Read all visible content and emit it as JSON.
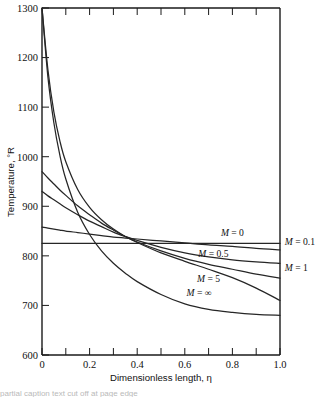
{
  "chart_data": {
    "type": "line",
    "title": "",
    "xlabel": "Dimensionless length, η",
    "ylabel": "Temperature, °R",
    "xlim": [
      0,
      1.0
    ],
    "ylim": [
      600,
      1300
    ],
    "grid": false,
    "legend_position": "inline-right",
    "xticks": [
      0,
      0.2,
      0.4,
      0.6,
      0.8,
      1.0
    ],
    "xticklabels": [
      "0",
      "0.2",
      "0.4",
      "0.6",
      "0.8",
      "1.0"
    ],
    "xminorticks": [
      0.1,
      0.3,
      0.5,
      0.7,
      0.9
    ],
    "yticks": [
      600,
      700,
      800,
      900,
      1000,
      1100,
      1200,
      1300
    ],
    "yticklabels": [
      "600",
      "700",
      "800",
      "900",
      "1000",
      "1100",
      "1200",
      "1300"
    ],
    "x": [
      0,
      0.025,
      0.05,
      0.075,
      0.1,
      0.15,
      0.2,
      0.25,
      0.3,
      0.35,
      0.4,
      0.5,
      0.6,
      0.7,
      0.8,
      0.9,
      1.0
    ],
    "series": [
      {
        "name": "M = 0",
        "label": "M = 0",
        "label_inside": true,
        "values": [
          825,
          825,
          825,
          825,
          825,
          825,
          825,
          825,
          825,
          825,
          825,
          825,
          825,
          825,
          825,
          825,
          825
        ]
      },
      {
        "name": "M = 0.1",
        "label": "M = 0.1",
        "label_inside": false,
        "values": [
          858,
          856,
          854,
          852,
          850,
          847,
          844,
          841,
          838,
          836,
          834,
          830,
          826,
          822,
          819,
          815,
          812
        ]
      },
      {
        "name": "M = 0.5",
        "label": "M = 0.5",
        "label_inside": true,
        "values": [
          930,
          921,
          913,
          905,
          897,
          883,
          870,
          859,
          848,
          839,
          831,
          817,
          806,
          798,
          792,
          788,
          785
        ]
      },
      {
        "name": "M = 1",
        "label": "M = 1",
        "label_inside": false,
        "values": [
          970,
          957,
          945,
          933,
          922,
          901,
          883,
          866,
          852,
          839,
          828,
          810,
          795,
          783,
          773,
          763,
          755
        ]
      },
      {
        "name": "M = 5",
        "label": "M = 5",
        "label_inside": true,
        "values": [
          1300,
          1175,
          1090,
          1032,
          990,
          934,
          898,
          873,
          854,
          839,
          827,
          806,
          789,
          773,
          756,
          735,
          710
        ]
      },
      {
        "name": "M = ∞",
        "label": "M = ∞",
        "label_inside": true,
        "values": [
          1300,
          1160,
          1068,
          1003,
          955,
          888,
          843,
          810,
          785,
          765,
          748,
          722,
          703,
          692,
          686,
          682,
          680
        ]
      }
    ],
    "annotations": [
      {
        "text": "M = 0",
        "x": 0.8,
        "y": 840,
        "placement": "inside-plot"
      },
      {
        "text": "M = 0.1",
        "x": 1.02,
        "y": 822,
        "placement": "outside-right"
      },
      {
        "text": "M = 0.5",
        "x": 0.72,
        "y": 797,
        "placement": "inside-plot"
      },
      {
        "text": "M = 1",
        "x": 1.02,
        "y": 770,
        "placement": "outside-right"
      },
      {
        "text": "M = 5",
        "x": 0.7,
        "y": 748,
        "placement": "inside-plot"
      },
      {
        "text": "M = ∞",
        "x": 0.66,
        "y": 720,
        "placement": "inside-plot"
      }
    ]
  },
  "axes": {
    "y_title": "Temperature, °R",
    "x_title": "Dimensionless length, η"
  },
  "ticks": {
    "y": [
      "1300",
      "1200",
      "1100",
      "1000",
      "900",
      "800",
      "700",
      "600"
    ],
    "x": [
      "0",
      "0.2",
      "0.4",
      "0.6",
      "0.8",
      "1.0"
    ]
  },
  "series_labels": {
    "m0": "M = 0",
    "m01": "M = 0.1",
    "m05": "M = 0.5",
    "m1": "M = 1",
    "m5": "M = 5",
    "minf": "M = ∞"
  },
  "caption": {
    "text": "partial caption text cut off at page edge"
  },
  "colors": {
    "curve": "#262626",
    "axis": "#1a1a1a",
    "background": "#ffffff"
  }
}
